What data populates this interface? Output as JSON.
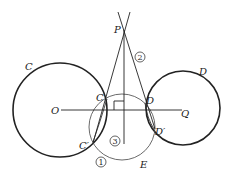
{
  "diagram": {
    "colors": {
      "stroke": "#222222",
      "thin": "#444444",
      "background": "#ffffff"
    },
    "labels": {
      "P": "P",
      "C_circle": "C",
      "D_circle": "D",
      "O": "O",
      "Q": "Q",
      "C_point": "C",
      "D_point": "D",
      "C_prime": "C′",
      "D_prime": "D′",
      "E": "E",
      "step1": "1",
      "step2": "2",
      "step3": "3"
    }
  }
}
